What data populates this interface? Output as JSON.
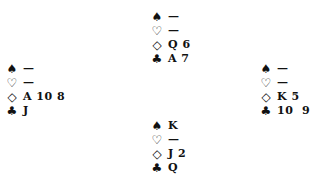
{
  "diagram": {
    "type": "bridge-hand",
    "suit_symbols": {
      "spades": "♠",
      "hearts": "♡",
      "diamonds": "◇",
      "clubs": "♣"
    },
    "hands": {
      "north": {
        "spades": "—",
        "hearts": "—",
        "diamonds": "Q 6",
        "clubs": "A 7"
      },
      "west": {
        "spades": "—",
        "hearts": "—",
        "diamonds": "A 10 8",
        "clubs": "J"
      },
      "east": {
        "spades": "—",
        "hearts": "—",
        "diamonds": "K 5",
        "clubs": "10  9"
      },
      "south": {
        "spades": "K",
        "hearts": "—",
        "diamonds": "J 2",
        "clubs": "Q"
      }
    }
  }
}
